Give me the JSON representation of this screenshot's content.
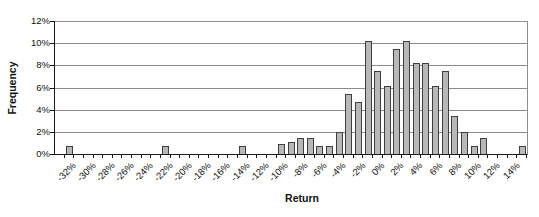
{
  "chart_data": {
    "type": "bar",
    "title": "",
    "xlabel": "Return",
    "ylabel": "Frequency",
    "y_unit": "%",
    "x_bin_width_pct": 1,
    "x_axis_range_pct": [
      -33,
      16
    ],
    "ylim": [
      0,
      12
    ],
    "y_step": 2,
    "grid": "horizontal",
    "legend": "none",
    "x": [
      -32,
      -22,
      -14,
      -10,
      -9,
      -8,
      -7,
      -6,
      -5,
      -4,
      -3,
      -2,
      -1,
      0,
      1,
      2,
      3,
      4,
      5,
      6,
      7,
      8,
      9,
      10,
      11,
      15
    ],
    "values": [
      0.7,
      0.7,
      0.7,
      0.9,
      1.1,
      1.4,
      1.4,
      0.7,
      0.7,
      2.0,
      5.4,
      4.7,
      10.2,
      7.5,
      6.1,
      9.5,
      10.2,
      8.2,
      8.2,
      6.1,
      7.5,
      3.4,
      2.0,
      0.7,
      1.4,
      0.7
    ],
    "x_tick_label_values": [
      -32,
      -30,
      -28,
      -26,
      -24,
      -22,
      -20,
      -18,
      -16,
      -14,
      -12,
      -10,
      -8,
      -6,
      -4,
      -2,
      0,
      2,
      4,
      6,
      8,
      10,
      12,
      14
    ],
    "x_tick_labels": [
      "-32%",
      "-30%",
      "-28%",
      "-26%",
      "-24%",
      "-22%",
      "-20%",
      "-18%",
      "-16%",
      "-14%",
      "-12%",
      "-10%",
      "-8%",
      "-6%",
      "-4%",
      "-2%",
      "0%",
      "2%",
      "4%",
      "6%",
      "8%",
      "10%",
      "12%",
      "14%"
    ],
    "y_tick_labels": [
      "0%",
      "2%",
      "4%",
      "6%",
      "8%",
      "10%",
      "12%"
    ],
    "colors": {
      "bar_fill": "#b8b8b8",
      "bar_border": "#3f3f3f",
      "gridline": "#8c8c8c",
      "axis": "#1a1a1a",
      "text": "#111111",
      "background": "#ffffff"
    }
  }
}
